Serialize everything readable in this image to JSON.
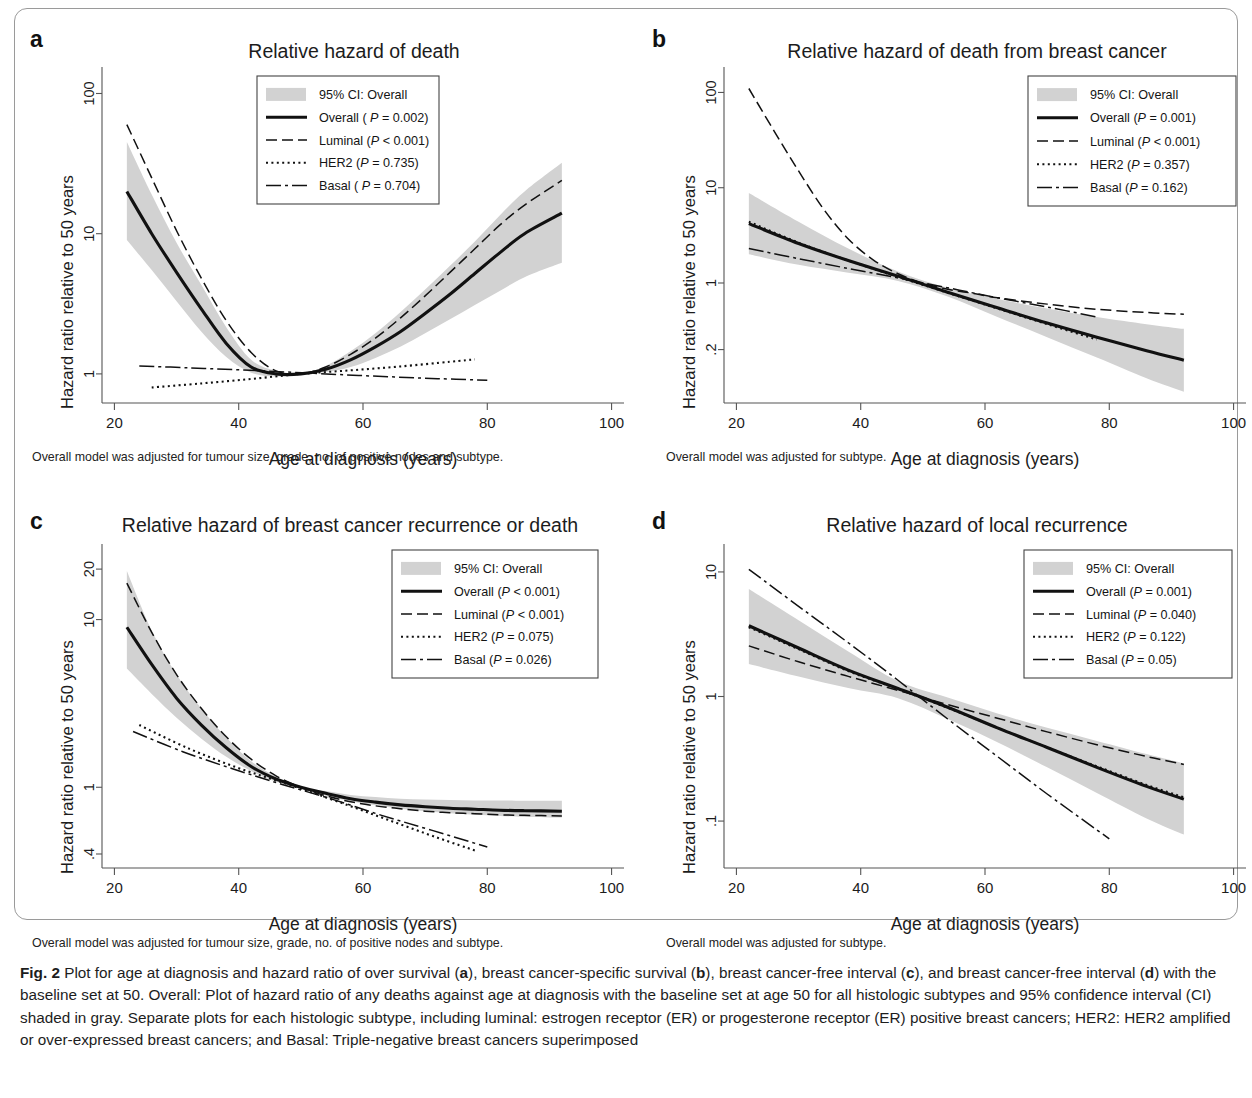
{
  "figure": {
    "label": "Fig. 2",
    "caption_parts": [
      {
        "t": "Fig. 2",
        "b": true
      },
      {
        "t": " Plot for age at diagnosis and hazard ratio of over survival ("
      },
      {
        "t": "a",
        "b": true
      },
      {
        "t": "), breast cancer-specific survival ("
      },
      {
        "t": "b",
        "b": true
      },
      {
        "t": "), breast cancer-free interval ("
      },
      {
        "t": "c",
        "b": true
      },
      {
        "t": "), and breast cancer-free interval ("
      },
      {
        "t": "d",
        "b": true
      },
      {
        "t": ") with the baseline set at 50. Overall: Plot of hazard ratio of any deaths against age at diagnosis with the baseline set at age 50 for all histologic subtypes and 95% confidence interval (CI) shaded in gray. Separate plots for each histologic subtype, including luminal: estrogen receptor (ER) or progesterone receptor (ER) positive breast cancers; HER2: HER2 amplified or over-expressed breast cancers; and Basal: Triple-negative breast cancers superimposed"
      }
    ]
  },
  "common": {
    "xlabel": "Age at diagnosis (years)",
    "ylabel": "Hazard ratio relative to 50 years",
    "xticks": [
      20,
      40,
      60,
      80,
      100
    ],
    "ci_color": "#d2d2d2",
    "line_color": "#111111",
    "footnote_full": "Overall model was adjusted for tumour size, grade, no. of positive nodes and subtype.",
    "footnote_subtype": "Overall model was adjusted for subtype."
  },
  "chart_data": [
    {
      "id": "a",
      "type": "line",
      "panel_letter": "a",
      "title": "Relative hazard of death",
      "xlabel": "Age at diagnosis (years)",
      "ylabel": "Hazard ratio relative to 50 years",
      "xlim": [
        18,
        102
      ],
      "ylim": [
        0.62,
        140
      ],
      "yscale": "log",
      "xticks": [
        20,
        40,
        60,
        80,
        100
      ],
      "yticks": [
        1,
        10,
        100
      ],
      "ytick_labels": [
        "1",
        "10",
        "100"
      ],
      "grid": false,
      "legend_position": "top-center",
      "legend_title": "95% CI: Overall",
      "footnote": "Overall model was adjusted for tumour size, grade, no. of positive nodes and subtype.",
      "series": [
        {
          "name": "Overall",
          "pvalue_text": "Overall ( P = 0.002)",
          "style": "solid",
          "x": [
            22,
            26,
            30,
            34,
            38,
            42,
            46,
            50,
            54,
            58,
            62,
            66,
            70,
            74,
            78,
            82,
            86,
            92
          ],
          "values": [
            20.0,
            10.0,
            5.3,
            2.9,
            1.65,
            1.12,
            1.0,
            1.0,
            1.08,
            1.26,
            1.56,
            2.0,
            2.7,
            3.7,
            5.2,
            7.3,
            10.0,
            14.0
          ]
        },
        {
          "name": "Luminal",
          "pvalue_text": "Luminal (P < 0.001)",
          "style": "dashed",
          "x": [
            22,
            26,
            30,
            34,
            38,
            42,
            46,
            50,
            54,
            58,
            62,
            66,
            70,
            74,
            78,
            82,
            86,
            92
          ],
          "values": [
            60.0,
            25.0,
            10.5,
            4.8,
            2.4,
            1.42,
            1.05,
            1.0,
            1.12,
            1.38,
            1.8,
            2.5,
            3.6,
            5.3,
            7.8,
            11.5,
            16.0,
            24.0
          ]
        },
        {
          "name": "HER2",
          "pvalue_text": "HER2 (P = 0.735)",
          "style": "dotted",
          "x": [
            26,
            34,
            42,
            50,
            58,
            66,
            74,
            78
          ],
          "values": [
            0.8,
            0.855,
            0.92,
            1.0,
            1.06,
            1.13,
            1.22,
            1.27
          ]
        },
        {
          "name": "Basal",
          "pvalue_text": "Basal ( P = 0.704)",
          "style": "dashdot",
          "x": [
            24,
            32,
            40,
            48,
            56,
            64,
            72,
            80
          ],
          "values": [
            1.14,
            1.105,
            1.07,
            1.03,
            0.99,
            0.955,
            0.925,
            0.9
          ]
        }
      ],
      "ci": {
        "x": [
          22,
          26,
          30,
          34,
          38,
          42,
          46,
          50,
          54,
          58,
          62,
          66,
          70,
          74,
          78,
          82,
          86,
          92
        ],
        "lower": [
          9.0,
          5.5,
          3.3,
          2.0,
          1.32,
          1.02,
          0.96,
          1.0,
          1.03,
          1.12,
          1.3,
          1.56,
          1.95,
          2.45,
          3.1,
          3.9,
          4.9,
          6.2
        ],
        "upper": [
          45.0,
          19.0,
          8.6,
          4.3,
          2.15,
          1.26,
          1.05,
          1.0,
          1.14,
          1.45,
          1.95,
          2.75,
          4.0,
          5.9,
          8.8,
          13.5,
          20.0,
          32.0
        ]
      }
    },
    {
      "id": "b",
      "type": "line",
      "panel_letter": "b",
      "title": "Relative hazard of death from breast cancer",
      "xlabel": "Age at diagnosis (years)",
      "ylabel": "Hazard ratio relative to 50 years",
      "xlim": [
        18,
        102
      ],
      "ylim": [
        0.055,
        160
      ],
      "yscale": "log",
      "xticks": [
        20,
        40,
        60,
        80,
        100
      ],
      "yticks": [
        0.2,
        1,
        10,
        100
      ],
      "ytick_labels": [
        ".2",
        "1",
        "10",
        "100"
      ],
      "grid": false,
      "legend_position": "top-right",
      "legend_title": "95% CI: Overall",
      "footnote": "Overall model was adjusted for subtype.",
      "series": [
        {
          "name": "Overall",
          "pvalue_text": "Overall (P = 0.001)",
          "style": "solid",
          "x": [
            22,
            30,
            38,
            46,
            54,
            62,
            70,
            78,
            86,
            92
          ],
          "values": [
            4.2,
            2.6,
            1.72,
            1.18,
            0.8,
            0.55,
            0.38,
            0.27,
            0.195,
            0.155
          ]
        },
        {
          "name": "Luminal",
          "pvalue_text": "Luminal (P < 0.001)",
          "style": "dashed",
          "x": [
            22,
            26,
            30,
            34,
            38,
            42,
            46,
            50,
            54,
            58,
            62,
            70,
            78,
            86,
            92
          ],
          "values": [
            110.0,
            40.0,
            15.0,
            6.0,
            2.9,
            1.75,
            1.25,
            1.0,
            0.86,
            0.78,
            0.7,
            0.6,
            0.53,
            0.49,
            0.47
          ]
        },
        {
          "name": "HER2",
          "pvalue_text": "HER2 (P = 0.357)",
          "style": "dotted",
          "x": [
            22,
            30,
            38,
            46,
            54,
            62,
            70,
            78
          ],
          "values": [
            4.4,
            2.65,
            1.72,
            1.16,
            0.79,
            0.54,
            0.37,
            0.255
          ]
        },
        {
          "name": "Basal",
          "pvalue_text": "Basal (P = 0.162)",
          "style": "dashdot",
          "x": [
            22,
            30,
            38,
            46,
            54,
            62,
            70,
            78
          ],
          "values": [
            2.3,
            1.8,
            1.42,
            1.13,
            0.89,
            0.7,
            0.56,
            0.44
          ]
        }
      ],
      "ci": {
        "x": [
          22,
          30,
          38,
          46,
          54,
          62,
          70,
          78,
          86,
          92
        ],
        "lower": [
          2.0,
          1.55,
          1.28,
          1.05,
          0.72,
          0.44,
          0.27,
          0.165,
          0.1,
          0.072
        ],
        "upper": [
          8.8,
          4.4,
          2.3,
          1.32,
          0.89,
          0.68,
          0.54,
          0.44,
          0.37,
          0.33
        ]
      }
    },
    {
      "id": "c",
      "type": "line",
      "panel_letter": "c",
      "title": "Relative hazard of breast cancer recurrence or death",
      "xlabel": "Age at diagnosis (years)",
      "ylabel": "Hazard ratio relative to 50 years",
      "xlim": [
        18,
        102
      ],
      "ylim": [
        0.33,
        26
      ],
      "yscale": "log",
      "xticks": [
        20,
        40,
        60,
        80,
        100
      ],
      "yticks": [
        0.4,
        1,
        10,
        20
      ],
      "ytick_labels": [
        ".4",
        "1",
        "10",
        "20"
      ],
      "grid": false,
      "legend_position": "top-right",
      "legend_title": "95% CI: Overall",
      "footnote": "Overall model was adjusted for tumour size, grade, no. of positive nodes and subtype.",
      "series": [
        {
          "name": "Overall",
          "pvalue_text": "Overall (P < 0.001)",
          "style": "solid",
          "x": [
            22,
            26,
            30,
            34,
            38,
            42,
            46,
            50,
            54,
            58,
            62,
            66,
            70,
            74,
            78,
            82,
            86,
            92
          ],
          "values": [
            9.0,
            5.4,
            3.4,
            2.35,
            1.72,
            1.33,
            1.12,
            1.0,
            0.92,
            0.855,
            0.815,
            0.785,
            0.765,
            0.75,
            0.74,
            0.73,
            0.725,
            0.72
          ]
        },
        {
          "name": "Luminal",
          "pvalue_text": "Luminal (P < 0.001)",
          "style": "dashed",
          "x": [
            22,
            26,
            30,
            34,
            38,
            42,
            46,
            50,
            54,
            58,
            62,
            66,
            70,
            74,
            78,
            82,
            86,
            92
          ],
          "values": [
            16.5,
            8.4,
            4.7,
            2.95,
            2.0,
            1.47,
            1.17,
            1.0,
            0.89,
            0.82,
            0.775,
            0.745,
            0.72,
            0.705,
            0.695,
            0.685,
            0.68,
            0.675
          ]
        },
        {
          "name": "HER2",
          "pvalue_text": "HER2 (P = 0.075)",
          "style": "dotted",
          "x": [
            24,
            32,
            40,
            48,
            56,
            64,
            72,
            78
          ],
          "values": [
            2.35,
            1.7,
            1.3,
            1.04,
            0.82,
            0.64,
            0.5,
            0.42
          ]
        },
        {
          "name": "Basal",
          "pvalue_text": "Basal (P = 0.026)",
          "style": "dashdot",
          "x": [
            23,
            31,
            39,
            47,
            55,
            63,
            71,
            80
          ],
          "values": [
            2.15,
            1.63,
            1.29,
            1.04,
            0.85,
            0.68,
            0.555,
            0.44
          ]
        }
      ],
      "ci": {
        "x": [
          22,
          26,
          30,
          34,
          38,
          42,
          46,
          50,
          54,
          58,
          62,
          66,
          70,
          74,
          78,
          82,
          86,
          92
        ],
        "lower": [
          5.1,
          3.6,
          2.6,
          1.95,
          1.52,
          1.25,
          1.08,
          1.0,
          0.89,
          0.825,
          0.78,
          0.745,
          0.72,
          0.7,
          0.685,
          0.675,
          0.665,
          0.66
        ],
        "upper": [
          19.5,
          8.6,
          4.7,
          2.95,
          1.98,
          1.43,
          1.16,
          1.0,
          0.95,
          0.9,
          0.875,
          0.855,
          0.845,
          0.84,
          0.835,
          0.835,
          0.83,
          0.83
        ]
      }
    },
    {
      "id": "d",
      "type": "line",
      "panel_letter": "d",
      "title": "Relative hazard of local recurrence",
      "xlabel": "Age at diagnosis (years)",
      "ylabel": "Hazard ratio relative to 50 years",
      "xlim": [
        18,
        102
      ],
      "ylim": [
        0.042,
        15
      ],
      "yscale": "log",
      "xticks": [
        20,
        40,
        60,
        80,
        100
      ],
      "yticks": [
        0.1,
        1,
        10
      ],
      "ytick_labels": [
        ".1",
        "1",
        "10"
      ],
      "grid": false,
      "legend_position": "top-right",
      "legend_title": "95% CI: Overall",
      "footnote": "Overall model was adjusted for subtype.",
      "series": [
        {
          "name": "Overall",
          "pvalue_text": "Overall (P = 0.001)",
          "style": "solid",
          "x": [
            22,
            30,
            38,
            46,
            54,
            62,
            70,
            78,
            86,
            92
          ],
          "values": [
            3.7,
            2.45,
            1.63,
            1.16,
            0.82,
            0.56,
            0.39,
            0.27,
            0.19,
            0.15
          ]
        },
        {
          "name": "Luminal",
          "pvalue_text": "Luminal (P = 0.040)",
          "style": "dashed",
          "x": [
            22,
            30,
            38,
            46,
            54,
            62,
            70,
            78,
            86,
            92
          ],
          "values": [
            2.55,
            1.9,
            1.45,
            1.12,
            0.86,
            0.67,
            0.52,
            0.41,
            0.33,
            0.285
          ]
        },
        {
          "name": "HER2",
          "pvalue_text": "HER2 (P = 0.122)",
          "style": "dotted",
          "x": [
            22,
            30,
            38,
            46,
            54,
            62,
            70,
            78,
            86,
            92
          ],
          "values": [
            3.6,
            2.4,
            1.6,
            1.15,
            0.81,
            0.56,
            0.39,
            0.275,
            0.195,
            0.155
          ]
        },
        {
          "name": "Basal",
          "pvalue_text": "Basal (P = 0.05)",
          "style": "dashdot",
          "x": [
            22,
            30,
            38,
            46,
            54,
            62,
            70,
            80
          ],
          "values": [
            10.5,
            5.3,
            2.7,
            1.35,
            0.66,
            0.33,
            0.165,
            0.072
          ]
        }
      ],
      "ci": {
        "x": [
          22,
          30,
          38,
          46,
          54,
          62,
          70,
          78,
          86,
          92
        ],
        "lower": [
          1.82,
          1.45,
          1.17,
          0.97,
          0.66,
          0.43,
          0.27,
          0.168,
          0.105,
          0.078
        ],
        "upper": [
          7.3,
          4.1,
          2.3,
          1.33,
          0.98,
          0.73,
          0.56,
          0.44,
          0.345,
          0.29
        ]
      }
    }
  ]
}
